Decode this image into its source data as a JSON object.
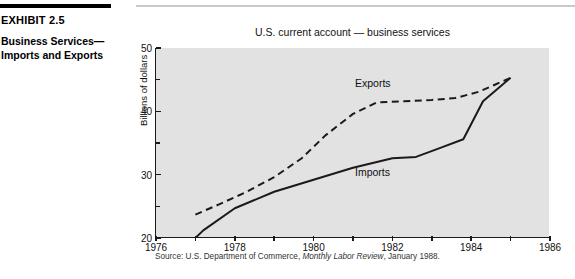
{
  "exhibit": {
    "number": "EXHIBIT 2.5",
    "caption_line1": "Business Services—",
    "caption_line2": "Imports and Exports"
  },
  "source": {
    "prefix": "Source: U.S. Department of Commerce, ",
    "italic": "Monthly Labor Review",
    "suffix": ", January 1988."
  },
  "chart_data": {
    "type": "line",
    "title": "U.S. current account — business services",
    "xlabel": "",
    "ylabel": "Billions of dollars",
    "xlim": [
      1976,
      1986
    ],
    "ylim": [
      20,
      50
    ],
    "xticks": [
      1976,
      1978,
      1980,
      1982,
      1984,
      1986
    ],
    "xticks_minor": [
      1977,
      1979,
      1981,
      1983,
      1985
    ],
    "yticks": [
      20,
      30,
      40,
      50
    ],
    "yticks_minor": [
      25,
      35,
      45
    ],
    "grid": false,
    "legend": "inline-labels",
    "series": [
      {
        "name": "Exports",
        "style": "dashed",
        "color": "#1a1a1a",
        "label_x": 1981.05,
        "label_y": 44.3,
        "x": [
          1977.0,
          1977.6,
          1978.3,
          1979.0,
          1979.7,
          1980.3,
          1981.0,
          1981.6,
          1982.3,
          1983.0,
          1983.6,
          1984.2,
          1984.6,
          1985.0
        ],
        "y": [
          23.7,
          25.3,
          27.3,
          29.6,
          32.6,
          36.2,
          39.6,
          41.4,
          41.6,
          41.8,
          42.1,
          43.1,
          44.2,
          45.3
        ]
      },
      {
        "name": "Imports",
        "style": "solid",
        "color": "#1a1a1a",
        "label_x": 1981.05,
        "label_y": 30.2,
        "x": [
          1977.0,
          1977.2,
          1978.0,
          1979.0,
          1980.0,
          1981.0,
          1982.0,
          1982.6,
          1983.2,
          1983.8,
          1984.3,
          1985.0
        ],
        "y": [
          20.0,
          21.2,
          24.7,
          27.3,
          29.2,
          31.1,
          32.6,
          32.8,
          34.2,
          35.6,
          41.6,
          45.3
        ]
      }
    ]
  }
}
